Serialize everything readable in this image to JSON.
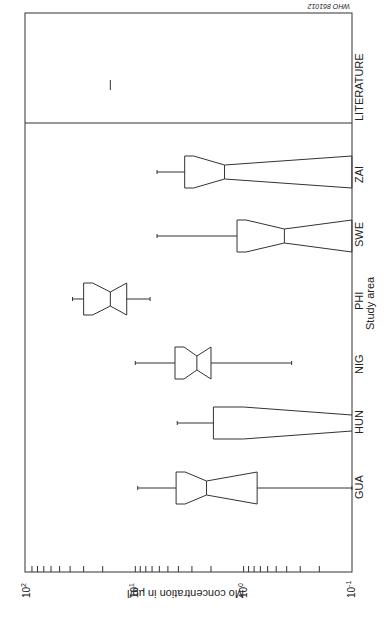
{
  "chart_data": {
    "type": "boxplot",
    "orientation": "rotated 90 degrees (categories along vertical edge, value axis along bottom)",
    "title": "",
    "corner_code": "WHO 861012",
    "xlabel": "Study area",
    "ylabel": "Mo concentration in µg/l",
    "yscale": "log",
    "ylim": [
      0.1,
      100
    ],
    "tick_labels": [
      "10^2",
      "10^1",
      "10^0",
      "10^-1"
    ],
    "tick_values": [
      100,
      10,
      1,
      0.1
    ],
    "grid": false,
    "categories": [
      "GUA",
      "HUN",
      "NIG",
      "PHI",
      "SWE",
      "ZAI",
      "LITERATURE"
    ],
    "boxes": [
      {
        "name": "GUA",
        "whisker_high": 9.5,
        "q3": 4.2,
        "median": 2.2,
        "q1": 0.75,
        "whisker_low": 0.1,
        "notched": true
      },
      {
        "name": "HUN",
        "whisker_high": 4.1,
        "q3": 1.9,
        "median": null,
        "q1": 0.1,
        "whisker_low": null,
        "notched": true
      },
      {
        "name": "NIG",
        "whisker_high": 10,
        "q3": 4.3,
        "median": 2.7,
        "q1": 2.0,
        "whisker_low": 0.36,
        "notched": true
      },
      {
        "name": "PHI",
        "whisker_high": 38,
        "q3": 30,
        "median": 17,
        "q1": 12,
        "whisker_low": 7.3,
        "notched": true
      },
      {
        "name": "SWE",
        "whisker_high": 6.3,
        "q3": 1.15,
        "median": 0.42,
        "q1": 0.1,
        "whisker_low": null,
        "notched": true
      },
      {
        "name": "ZAI",
        "whisker_high": 6.3,
        "q3": 3.5,
        "median": 1.5,
        "q1": 0.1,
        "whisker_low": null,
        "notched": true
      },
      {
        "name": "LITERATURE",
        "value": 17,
        "marker": "line"
      }
    ]
  },
  "labels": {
    "corner_code": "WHO 861012",
    "x_axis_title": "Study area",
    "y_axis_title": "Mo concentration in µg/l",
    "ticks": [
      "10",
      "10",
      "10",
      "10"
    ],
    "tick_exps": [
      "2",
      "1",
      "0",
      "-1"
    ],
    "categories": [
      "GUA",
      "HUN",
      "NIG",
      "PHI",
      "SWE",
      "ZAI",
      "LITERATURE"
    ]
  }
}
